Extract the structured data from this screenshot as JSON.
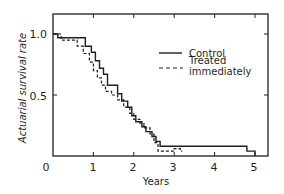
{
  "chart_data": {
    "type": "line",
    "title": "",
    "xlabel": "Years",
    "ylabel": "Actuarial survival rate",
    "xlim": [
      0,
      5.4
    ],
    "ylim": [
      0,
      1.15
    ],
    "x_ticks": [
      "0",
      "1",
      "2",
      "3",
      "4",
      "5"
    ],
    "y_ticks": [
      "0",
      "0.5",
      "1.0"
    ],
    "grid": false,
    "legend_position": "upper right",
    "step": true,
    "series": [
      {
        "name": "Control",
        "style": "solid",
        "x": [
          0,
          0.12,
          0.12,
          0.8,
          0.8,
          0.95,
          0.95,
          1.05,
          1.05,
          1.15,
          1.15,
          1.25,
          1.25,
          1.35,
          1.35,
          1.6,
          1.6,
          1.7,
          1.7,
          1.85,
          1.85,
          1.95,
          1.95,
          2.05,
          2.05,
          2.2,
          2.2,
          2.3,
          2.3,
          2.45,
          2.45,
          2.55,
          2.55,
          2.65,
          2.65,
          4.8,
          4.8,
          5.0,
          5.0
        ],
        "values": [
          1.0,
          1.0,
          0.97,
          0.97,
          0.9,
          0.9,
          0.85,
          0.85,
          0.78,
          0.78,
          0.72,
          0.72,
          0.67,
          0.67,
          0.58,
          0.58,
          0.51,
          0.51,
          0.45,
          0.45,
          0.4,
          0.4,
          0.33,
          0.33,
          0.28,
          0.28,
          0.24,
          0.24,
          0.2,
          0.2,
          0.16,
          0.16,
          0.12,
          0.12,
          0.08,
          0.08,
          0.04,
          0.04,
          0.0
        ]
      },
      {
        "name": "Treated immediately",
        "style": "dashed",
        "x": [
          0,
          0.2,
          0.2,
          0.6,
          0.6,
          0.75,
          0.75,
          0.9,
          0.9,
          1.0,
          1.0,
          1.1,
          1.1,
          1.2,
          1.2,
          1.3,
          1.3,
          1.45,
          1.45,
          1.6,
          1.6,
          1.75,
          1.75,
          1.9,
          1.9,
          2.0,
          2.0,
          2.15,
          2.15,
          2.25,
          2.25,
          2.4,
          2.4,
          2.5,
          2.5,
          2.6,
          2.6,
          3.0,
          3.0,
          3.15,
          3.15,
          3.2
        ],
        "values": [
          1.0,
          1.0,
          0.95,
          0.95,
          0.9,
          0.9,
          0.84,
          0.84,
          0.77,
          0.77,
          0.7,
          0.7,
          0.64,
          0.64,
          0.58,
          0.58,
          0.53,
          0.53,
          0.5,
          0.5,
          0.46,
          0.46,
          0.4,
          0.4,
          0.35,
          0.35,
          0.3,
          0.3,
          0.27,
          0.27,
          0.23,
          0.23,
          0.18,
          0.18,
          0.11,
          0.11,
          0.04,
          0.04,
          0.06,
          0.06,
          0.04,
          0.04
        ]
      }
    ],
    "legend": [
      "Control",
      "Treated immediately"
    ]
  },
  "legend": {
    "control_label": "Control",
    "treated_line1": "Treated",
    "treated_line2": "immediately"
  },
  "axes": {
    "xlabel": "Years",
    "ylabel": "Actuarial survival rate",
    "x_tick_labels": [
      "0",
      "1",
      "2",
      "3",
      "4",
      "5"
    ],
    "y_tick_labels": [
      "1.0",
      "0.5"
    ]
  },
  "colors": {
    "ink": "#1f1f1f",
    "background": "#ffffff"
  }
}
